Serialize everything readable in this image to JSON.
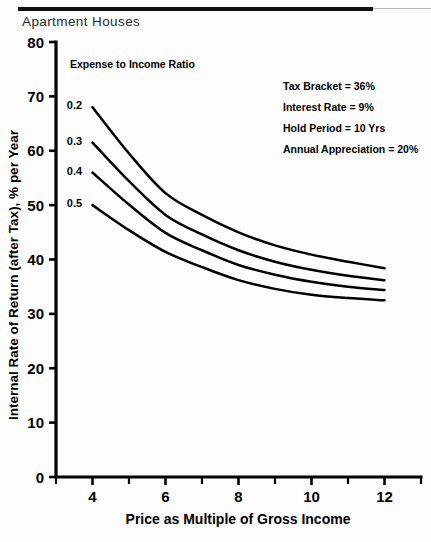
{
  "figure": {
    "title": "Apartment Houses",
    "has_top_rule": true
  },
  "chart_data": {
    "type": "line",
    "title": "Apartment Houses",
    "xlabel": "Price as Multiple of Gross Income",
    "ylabel": "Internal Rate of Return (after Tax), % per Year",
    "xlim": [
      3,
      13
    ],
    "ylim": [
      0,
      80
    ],
    "xticks": [
      4,
      6,
      8,
      10,
      12
    ],
    "xtick_labels": [
      "4",
      "6",
      "8",
      "10",
      "12"
    ],
    "x_minor_ticks": [
      3,
      5,
      7,
      9,
      11,
      13
    ],
    "yticks": [
      0,
      10,
      20,
      30,
      40,
      50,
      60,
      70,
      80
    ],
    "ytick_labels": [
      "0",
      "10",
      "20",
      "30",
      "40",
      "50",
      "60",
      "70",
      "80"
    ],
    "grid": false,
    "legend_position": "inline-left-labels",
    "series_legend_title": "Expense to Income Ratio",
    "x": [
      4,
      5,
      6,
      7,
      8,
      9,
      10,
      11,
      12
    ],
    "series": [
      {
        "name": "0.2",
        "label": "0.2",
        "values": [
          68.0,
          59.5,
          52.2,
          48.2,
          45.0,
          42.6,
          40.9,
          39.6,
          38.4
        ]
      },
      {
        "name": "0.3",
        "label": "0.3",
        "values": [
          61.5,
          54.4,
          48.2,
          44.6,
          41.7,
          39.6,
          38.1,
          37.0,
          36.2
        ]
      },
      {
        "name": "0.4",
        "label": "0.4",
        "values": [
          56.0,
          50.1,
          44.9,
          41.7,
          39.0,
          37.2,
          35.9,
          35.0,
          34.4
        ]
      },
      {
        "name": "0.5",
        "label": "0.5",
        "values": [
          50.0,
          45.4,
          41.4,
          38.6,
          36.2,
          34.6,
          33.5,
          32.9,
          32.5
        ]
      }
    ],
    "annotations": [
      "Tax Bracket = 36%",
      "Interest Rate = 9%",
      "Hold Period = 10 Yrs",
      "Annual Appreciation = 20%"
    ]
  },
  "colors": {
    "ink": "#000000",
    "paper": "#fdfdfd",
    "rule": "#111111"
  }
}
